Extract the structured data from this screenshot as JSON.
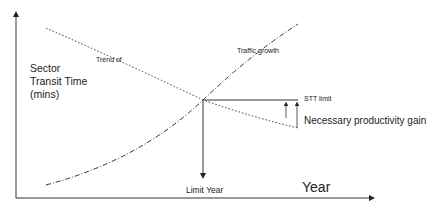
{
  "diagram": {
    "y_axis_label": "Sector Transit Time (mins)",
    "x_axis_label": "Year",
    "curves": [
      {
        "name": "Trend of",
        "style": "dotted"
      },
      {
        "name": "Traffic growth",
        "style": "dash-dot"
      }
    ],
    "stt_limit_label": "STT limit",
    "productivity_label": "Necessary productivity gain",
    "limit_year_label": "Limit Year",
    "colors": {
      "line": "#222222",
      "background": "#ffffff"
    }
  }
}
